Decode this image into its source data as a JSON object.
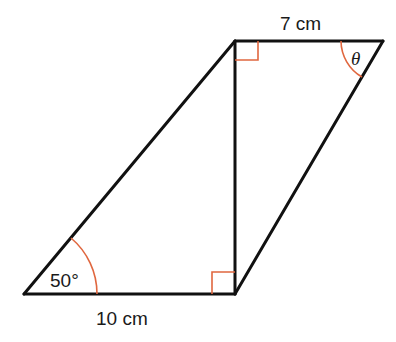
{
  "diagram": {
    "type": "geometry",
    "labels": {
      "top_side": "7 cm",
      "bottom_side": "10 cm",
      "bottom_left_angle": "50°",
      "top_right_angle": "θ"
    },
    "vertices": {
      "bottom_left": [
        24,
        294
      ],
      "bottom_right": [
        235,
        294
      ],
      "top_left": [
        235,
        41
      ],
      "top_right": [
        383,
        41
      ]
    },
    "right_angle_marks": [
      "top_left_vertical",
      "bottom_right_vertical"
    ],
    "colors": {
      "lines": "#111111",
      "angle_marks": "#e0673f"
    }
  }
}
